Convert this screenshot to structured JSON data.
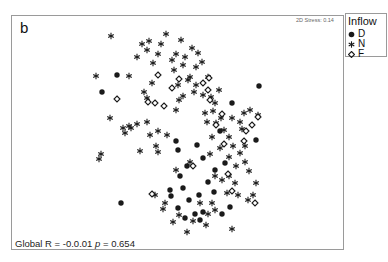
{
  "chart_data": {
    "type": "scatter",
    "title": "b",
    "subtitle": "2D Stress: 0.14",
    "xlabel": "",
    "ylabel": "",
    "grid": false,
    "legend_position": "top-right outside",
    "legend_title": "Inflow",
    "annotation": "Global R = -0.0.01  p = 0.654",
    "coordinate_note": "nMDS ordination; points given in image pixel coordinates (no axes shown)",
    "series": [
      {
        "name": "D",
        "marker": "filled-circle",
        "points": [
          [
            117,
            75
          ],
          [
            102,
            92
          ],
          [
            259,
            86
          ],
          [
            232,
            103
          ],
          [
            220,
            131
          ],
          [
            176,
            141
          ],
          [
            197,
            145
          ],
          [
            178,
            150
          ],
          [
            256,
            140
          ],
          [
            203,
            158
          ],
          [
            225,
            163
          ],
          [
            187,
            166
          ],
          [
            215,
            170
          ],
          [
            208,
            182
          ],
          [
            180,
            176
          ],
          [
            183,
            188
          ],
          [
            170,
            190
          ],
          [
            199,
            195
          ],
          [
            189,
            200
          ],
          [
            171,
            196
          ],
          [
            121,
            203
          ],
          [
            203,
            212
          ],
          [
            214,
            192
          ],
          [
            195,
            214
          ],
          [
            185,
            218
          ],
          [
            222,
            214
          ],
          [
            230,
            207
          ],
          [
            200,
            220
          ],
          [
            178,
            208
          ]
        ]
      },
      {
        "name": "N",
        "marker": "asterisk",
        "points": [
          [
            111,
            36
          ],
          [
            96,
            76
          ],
          [
            129,
            76
          ],
          [
            142,
            44
          ],
          [
            149,
            41
          ],
          [
            161,
            44
          ],
          [
            147,
            50
          ],
          [
            158,
            54
          ],
          [
            137,
            57
          ],
          [
            153,
            63
          ],
          [
            166,
            34
          ],
          [
            181,
            40
          ],
          [
            176,
            54
          ],
          [
            172,
            60
          ],
          [
            185,
            57
          ],
          [
            192,
            48
          ],
          [
            198,
            53
          ],
          [
            183,
            65
          ],
          [
            196,
            67
          ],
          [
            190,
            77
          ],
          [
            202,
            62
          ],
          [
            208,
            77
          ],
          [
            174,
            70
          ],
          [
            178,
            85
          ],
          [
            188,
            80
          ],
          [
            196,
            85
          ],
          [
            194,
            92
          ],
          [
            203,
            95
          ],
          [
            211,
            97
          ],
          [
            215,
            103
          ],
          [
            219,
            90
          ],
          [
            183,
            96
          ],
          [
            179,
            100
          ],
          [
            176,
            110
          ],
          [
            205,
            113
          ],
          [
            213,
            111
          ],
          [
            207,
            122
          ],
          [
            221,
            118
          ],
          [
            216,
            123
          ],
          [
            224,
            130
          ],
          [
            232,
            118
          ],
          [
            240,
            122
          ],
          [
            244,
            113
          ],
          [
            250,
            110
          ],
          [
            258,
            115
          ],
          [
            242,
            129
          ],
          [
            229,
            137
          ],
          [
            212,
            137
          ],
          [
            220,
            148
          ],
          [
            233,
            146
          ],
          [
            240,
            153
          ],
          [
            245,
            162
          ],
          [
            249,
            171
          ],
          [
            129,
            126
          ],
          [
            123,
            128
          ],
          [
            131,
            128
          ],
          [
            137,
            124
          ],
          [
            125,
            133
          ],
          [
            150,
            135
          ],
          [
            167,
            135
          ],
          [
            156,
            146
          ],
          [
            158,
            152
          ],
          [
            140,
            151
          ],
          [
            101,
            154
          ],
          [
            99,
            159
          ],
          [
            176,
            170
          ],
          [
            190,
            162
          ],
          [
            210,
            154
          ],
          [
            215,
            176
          ],
          [
            222,
            180
          ],
          [
            229,
            176
          ],
          [
            235,
            183
          ],
          [
            238,
            195
          ],
          [
            227,
            193
          ],
          [
            212,
            203
          ],
          [
            200,
            203
          ],
          [
            215,
            210
          ],
          [
            208,
            214
          ],
          [
            206,
            225
          ],
          [
            193,
            221
          ],
          [
            187,
            232
          ],
          [
            179,
            215
          ],
          [
            165,
            203
          ],
          [
            163,
            209
          ],
          [
            173,
            222
          ],
          [
            155,
            195
          ],
          [
            232,
            229
          ],
          [
            248,
            200
          ],
          [
            253,
            195
          ],
          [
            256,
            183
          ],
          [
            236,
            166
          ],
          [
            229,
            157
          ],
          [
            245,
            146
          ],
          [
            152,
            83
          ],
          [
            147,
            98
          ],
          [
            147,
            122
          ],
          [
            158,
            131
          ],
          [
            110,
            118
          ],
          [
            144,
            92
          ]
        ]
      },
      {
        "name": "F",
        "marker": "open-diamond",
        "points": [
          [
            117,
            99
          ],
          [
            158,
            75
          ],
          [
            148,
            102
          ],
          [
            164,
            106
          ],
          [
            172,
            88
          ],
          [
            179,
            79
          ],
          [
            203,
            83
          ],
          [
            209,
            78
          ],
          [
            210,
            100
          ],
          [
            222,
            114
          ],
          [
            216,
            125
          ],
          [
            224,
            144
          ],
          [
            246,
            131
          ],
          [
            252,
            125
          ],
          [
            258,
            117
          ],
          [
            244,
            141
          ],
          [
            193,
            166
          ],
          [
            228,
            174
          ],
          [
            232,
            191
          ],
          [
            152,
            194
          ],
          [
            255,
            203
          ],
          [
            155,
            103
          ],
          [
            208,
            90
          ]
        ]
      }
    ]
  },
  "panel": {
    "label": "b",
    "stress_text": "2D Stress: 0.14",
    "stat_prefix": "Global R = -0.0.01 ",
    "stat_p_symbol": "p",
    "stat_p_value": " =  0.654"
  },
  "legend": {
    "title": "Inflow",
    "items": [
      {
        "label": "D",
        "marker": "filled-circle"
      },
      {
        "label": "N",
        "marker": "asterisk"
      },
      {
        "label": "F",
        "marker": "open-diamond"
      }
    ]
  },
  "colors": {
    "marker": "#1a1a1a",
    "frame": "#9a9a9a",
    "background": "#ffffff"
  }
}
